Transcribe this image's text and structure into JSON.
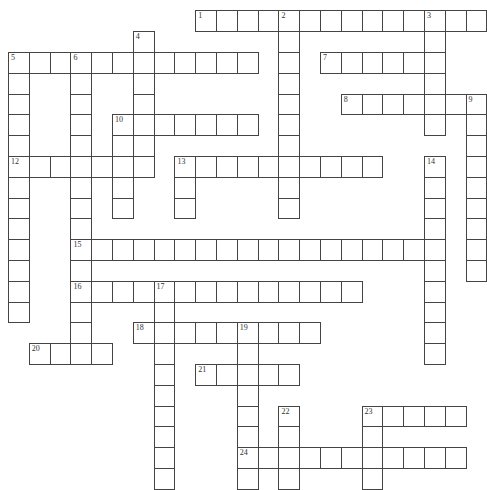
{
  "puzzle": {
    "type": "crossword",
    "cell_size": 20.8,
    "origin": {
      "x": 8,
      "y": 10.4
    },
    "line_color": "#444444",
    "cell_fill": "#ffffff",
    "words": [
      {
        "number": "1",
        "dir": "across",
        "row": 0,
        "col": 9,
        "len": 14
      },
      {
        "number": "2",
        "dir": "down",
        "row": 0,
        "col": 13,
        "len": 10
      },
      {
        "number": "3",
        "dir": "down",
        "row": 0,
        "col": 20,
        "len": 6
      },
      {
        "number": "4",
        "dir": "down",
        "row": 1,
        "col": 6,
        "len": 7
      },
      {
        "number": "5",
        "dir": "across",
        "row": 2,
        "col": 0,
        "len": 12
      },
      {
        "number": "5",
        "dir": "down",
        "row": 2,
        "col": 0,
        "len": 13
      },
      {
        "number": "6",
        "dir": "down",
        "row": 2,
        "col": 3,
        "len": 15
      },
      {
        "number": "7",
        "dir": "across",
        "row": 2,
        "col": 15,
        "len": 6
      },
      {
        "number": "8",
        "dir": "across",
        "row": 4,
        "col": 16,
        "len": 7
      },
      {
        "number": "9",
        "dir": "down",
        "row": 4,
        "col": 22,
        "len": 9
      },
      {
        "number": "10",
        "dir": "across",
        "row": 5,
        "col": 5,
        "len": 7
      },
      {
        "number": "10",
        "dir": "down",
        "row": 5,
        "col": 5,
        "len": 5
      },
      {
        "number": "12",
        "dir": "across",
        "row": 7,
        "col": 0,
        "len": 7
      },
      {
        "number": "13",
        "dir": "across",
        "row": 7,
        "col": 8,
        "len": 10
      },
      {
        "number": "13",
        "dir": "down",
        "row": 7,
        "col": 8,
        "len": 3
      },
      {
        "number": "14",
        "dir": "down",
        "row": 7,
        "col": 20,
        "len": 10
      },
      {
        "number": "15",
        "dir": "across",
        "row": 11,
        "col": 3,
        "len": 18
      },
      {
        "number": "16",
        "dir": "across",
        "row": 13,
        "col": 3,
        "len": 14
      },
      {
        "number": "17",
        "dir": "down",
        "row": 13,
        "col": 7,
        "len": 10
      },
      {
        "number": "18",
        "dir": "across",
        "row": 15,
        "col": 6,
        "len": 9
      },
      {
        "number": "19",
        "dir": "down",
        "row": 15,
        "col": 11,
        "len": 8
      },
      {
        "number": "20",
        "dir": "across",
        "row": 16,
        "col": 1,
        "len": 4
      },
      {
        "number": "21",
        "dir": "across",
        "row": 17,
        "col": 9,
        "len": 5
      },
      {
        "number": "22",
        "dir": "down",
        "row": 19,
        "col": 13,
        "len": 4
      },
      {
        "number": "23",
        "dir": "across",
        "row": 19,
        "col": 17,
        "len": 5
      },
      {
        "number": "23",
        "dir": "down",
        "row": 19,
        "col": 17,
        "len": 4
      },
      {
        "number": "24",
        "dir": "across",
        "row": 21,
        "col": 11,
        "len": 11
      }
    ]
  }
}
